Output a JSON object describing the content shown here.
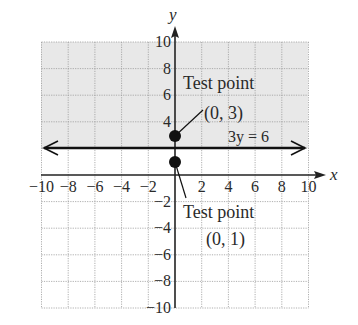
{
  "chart_data": {
    "type": "scatter",
    "title": "",
    "xlabel": "x",
    "ylabel": "y",
    "xlim": [
      -10,
      10
    ],
    "ylim": [
      -10,
      10
    ],
    "grid": true,
    "x_ticks": [
      "-10",
      "-8",
      "-6",
      "-4",
      "-2",
      "2",
      "4",
      "6",
      "8",
      "10"
    ],
    "y_ticks": [
      "10",
      "8",
      "6",
      "4",
      "-2",
      "-4",
      "-6",
      "-8",
      "-10"
    ],
    "shaded_region": {
      "description": "y > 2 (half-plane above the line)",
      "color": "#e6e6e6"
    },
    "lines": [
      {
        "name": "3y = 6",
        "equation": "y = 2",
        "label": "3y = 6",
        "style": "solid",
        "arrows": true
      }
    ],
    "points": [
      {
        "x": 0,
        "y": 3,
        "label_line1": "Test point",
        "label_line2": "(0, 3)"
      },
      {
        "x": 0,
        "y": 1,
        "label_line1": "Test point",
        "label_line2": "(0, 1)"
      }
    ],
    "colors": {
      "shade": "#e6e6e6",
      "grid": "#aaaaaa",
      "axis": "#222222",
      "point": "#111111"
    }
  },
  "labels": {
    "x_axis": "x",
    "y_axis": "y",
    "line_label": "3y = 6",
    "tp1_line1": "Test point",
    "tp1_line2": "(0, 3)",
    "tp2_line1": "Test point",
    "tp2_line2": "(0, 1)"
  }
}
